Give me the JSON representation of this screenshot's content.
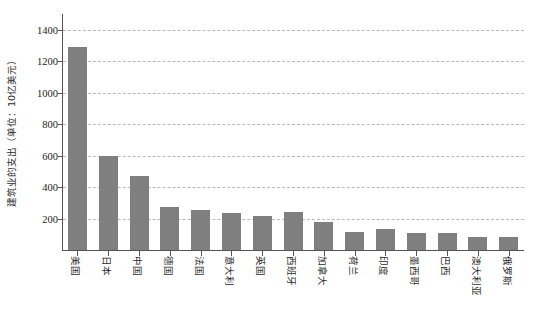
{
  "chart_data": {
    "type": "bar",
    "title": "",
    "subtitle": "",
    "xlabel": "",
    "ylabel": "建筑业的支出（单位：10亿美元）",
    "ylim": [
      0,
      1500
    ],
    "yticks": [
      200,
      400,
      600,
      800,
      1000,
      1200,
      1400
    ],
    "ytick_labels": [
      "200",
      "400",
      "600",
      "800",
      "1000",
      "1200",
      "1400"
    ],
    "grid": true,
    "legend": false,
    "legend_position": "none",
    "bar_color": "#7f7f7f",
    "categories": [
      "美国",
      "日本",
      "中国",
      "德国",
      "法国",
      "意大利",
      "英国",
      "西班牙",
      "加拿大",
      "荷兰",
      "印度",
      "墨西哥",
      "巴西",
      "澳大利亚",
      "俄罗斯"
    ],
    "values": [
      1290,
      600,
      470,
      275,
      255,
      235,
      215,
      240,
      180,
      115,
      135,
      110,
      110,
      85,
      80
    ]
  },
  "axes": {
    "y_axis_color": "#555555",
    "x_axis_color": "#555555",
    "gridline_color": "#b8b8b8"
  }
}
